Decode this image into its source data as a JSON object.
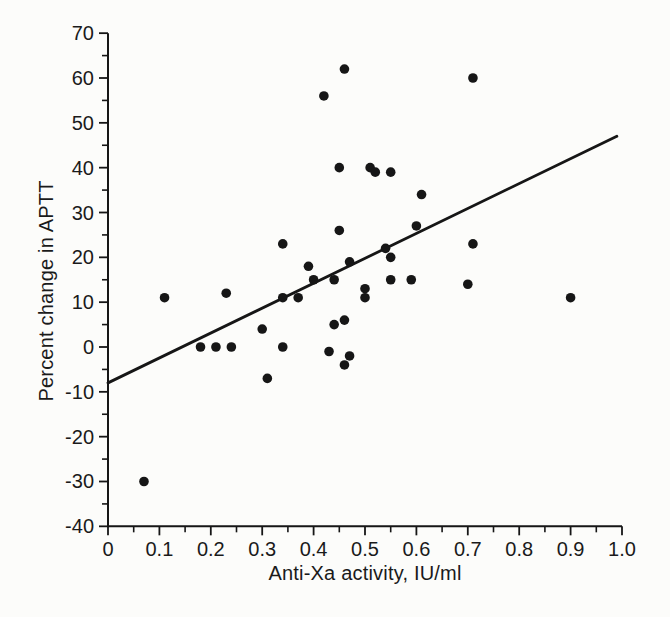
{
  "figure": {
    "background_color": "#fcfcfa",
    "ink_color": "#161616"
  },
  "chart_data": {
    "type": "scatter",
    "title": "",
    "xlabel": "Anti-Xa activity, IU/ml",
    "ylabel": "Percent change in APTT",
    "xlim": [
      0,
      1.0
    ],
    "ylim": [
      -40,
      70
    ],
    "grid": false,
    "legend": "none",
    "x_tick_values": [
      0,
      0.1,
      0.2,
      0.3,
      0.4,
      0.5,
      0.6,
      0.7,
      0.8,
      0.9,
      1.0
    ],
    "x_tick_labels": [
      "0",
      "0.1",
      "0.2",
      "0.3",
      "0.4",
      "0.5",
      "0.6",
      "0.7",
      "0.8",
      "0.9",
      "1.0"
    ],
    "x_minor_tick_values": [
      0.05,
      0.15,
      0.25,
      0.35,
      0.45,
      0.55,
      0.65,
      0.75,
      0.85,
      0.95
    ],
    "y_tick_values": [
      70,
      60,
      50,
      40,
      30,
      20,
      10,
      0,
      -10,
      -20,
      -30,
      -40
    ],
    "y_tick_labels": [
      "70",
      "60",
      "50",
      "40",
      "30",
      "20",
      "10",
      "0",
      "-10",
      "-20",
      "-30",
      "-40"
    ],
    "y_minor_tick_values": [
      65,
      55,
      45,
      35,
      25,
      15,
      5,
      -5,
      -15,
      -25,
      -35
    ],
    "points": [
      [
        0.07,
        -30
      ],
      [
        0.11,
        11
      ],
      [
        0.18,
        0
      ],
      [
        0.21,
        0
      ],
      [
        0.23,
        12
      ],
      [
        0.24,
        0
      ],
      [
        0.3,
        4
      ],
      [
        0.31,
        -7
      ],
      [
        0.34,
        0
      ],
      [
        0.34,
        11
      ],
      [
        0.34,
        23
      ],
      [
        0.37,
        11
      ],
      [
        0.39,
        18
      ],
      [
        0.4,
        15
      ],
      [
        0.42,
        56
      ],
      [
        0.43,
        -1
      ],
      [
        0.44,
        5
      ],
      [
        0.44,
        15
      ],
      [
        0.45,
        26
      ],
      [
        0.45,
        40
      ],
      [
        0.46,
        -4
      ],
      [
        0.46,
        6
      ],
      [
        0.46,
        62
      ],
      [
        0.47,
        -2
      ],
      [
        0.47,
        19
      ],
      [
        0.5,
        11
      ],
      [
        0.5,
        13
      ],
      [
        0.51,
        40
      ],
      [
        0.52,
        39
      ],
      [
        0.54,
        22
      ],
      [
        0.55,
        15
      ],
      [
        0.55,
        20
      ],
      [
        0.55,
        39
      ],
      [
        0.59,
        15
      ],
      [
        0.6,
        27
      ],
      [
        0.61,
        34
      ],
      [
        0.7,
        14
      ],
      [
        0.71,
        23
      ],
      [
        0.71,
        60
      ],
      [
        0.9,
        11
      ]
    ],
    "regression_line": {
      "x_start": 0,
      "y_start": -8,
      "x_end": 0.99,
      "y_end": 47
    }
  }
}
